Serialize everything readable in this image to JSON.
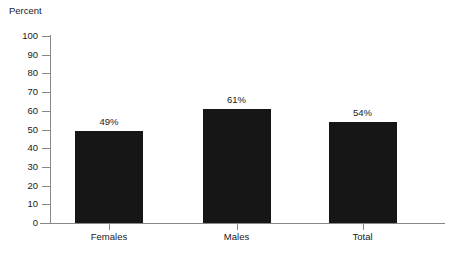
{
  "chart_data": {
    "type": "bar",
    "title": "",
    "ylabel": "Percent",
    "xlabel": "",
    "categories": [
      "Females",
      "Males",
      "Total"
    ],
    "values": [
      49,
      61,
      54
    ],
    "value_labels": [
      "49%",
      "61%",
      "54%"
    ],
    "ylim": [
      0,
      100
    ],
    "ytick_step": 10,
    "yticks": [
      0,
      10,
      20,
      30,
      40,
      50,
      60,
      70,
      80,
      90,
      100
    ],
    "ytick_labels": [
      "0",
      "10",
      "20",
      "30",
      "40",
      "50",
      "60",
      "70",
      "80",
      "90",
      "100"
    ],
    "grid": false,
    "legend": false,
    "legend_position": "none",
    "bar_color": "#161616",
    "axis_color": "#888888",
    "text_color": "#1a1a1a",
    "background_color": "#ffffff"
  }
}
